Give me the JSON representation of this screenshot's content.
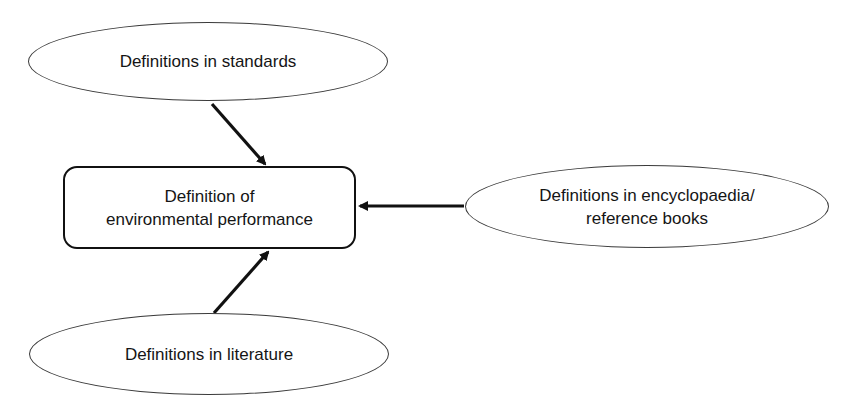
{
  "diagram": {
    "central": {
      "label": "Definition of\nenvironmental performance"
    },
    "sources": [
      {
        "id": "standards",
        "label": "Definitions in standards"
      },
      {
        "id": "encyclopaedia",
        "label": "Definitions in encyclopaedia/\nreference books"
      },
      {
        "id": "literature",
        "label": "Definitions in literature"
      }
    ],
    "edges": [
      {
        "from": "standards",
        "to": "central"
      },
      {
        "from": "encyclopaedia",
        "to": "central"
      },
      {
        "from": "literature",
        "to": "central"
      }
    ],
    "colors": {
      "stroke": "#111111",
      "ellipse_stroke": "#3a3a3a",
      "background": "#ffffff"
    }
  }
}
